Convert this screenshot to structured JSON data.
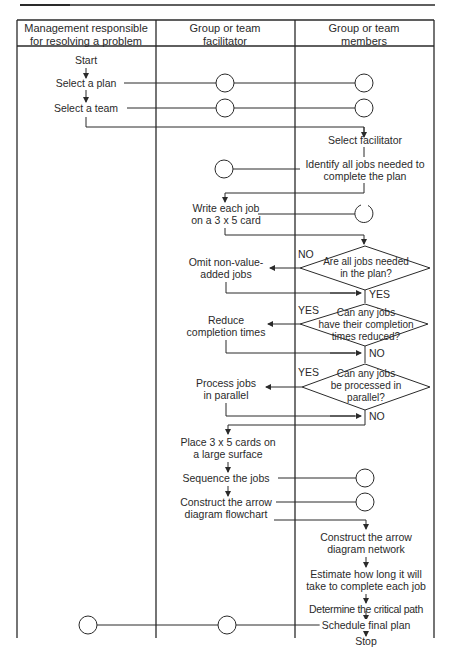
{
  "header": {
    "columns": [
      {
        "line1": "Management responsible",
        "line2": "for resolving a problem"
      },
      {
        "line1": "Group or team",
        "line2": "facilitator"
      },
      {
        "line1": "Group or team",
        "line2": "members"
      }
    ]
  },
  "management": {
    "start": "Start",
    "select_plan": "Select a plan",
    "select_team": "Select a team"
  },
  "facilitator": {
    "write_card_1": "Write each job",
    "write_card_2": "on a 3 x 5 card",
    "omit_1": "Omit non-value-",
    "omit_2": "added jobs",
    "reduce_1": "Reduce",
    "reduce_2": "completion times",
    "parallel_1": "Process jobs",
    "parallel_2": "in parallel",
    "place_1": "Place 3 x 5 cards on",
    "place_2": "a large surface",
    "sequence": "Sequence the jobs",
    "construct_1": "Construct the arrow",
    "construct_2": "diagram flowchart"
  },
  "members": {
    "select_facilitator": "Select facilitator",
    "identify_1": "Identify all jobs needed to",
    "identify_2": "complete the plan",
    "decision1": {
      "line1": "Are all jobs needed",
      "line2": "in the plan?",
      "no": "NO",
      "yes": "YES"
    },
    "decision2": {
      "line1": "Can any jobs",
      "line2": "have their completion",
      "line3": "times reduced?",
      "yes": "YES",
      "no": "NO"
    },
    "decision3": {
      "line1": "Can any jobs",
      "line2": "be processed in",
      "line3": "parallel?",
      "yes": "YES",
      "no": "NO"
    },
    "network_1": "Construct the arrow",
    "network_2": "diagram network",
    "estimate_1": "Estimate how long it will",
    "estimate_2": "take to complete each job",
    "critical_path": "Determine the critical path",
    "schedule": "Schedule final plan",
    "stop": "Stop"
  },
  "colors": {
    "line": "#2a2a2a",
    "background": "#ffffff"
  }
}
